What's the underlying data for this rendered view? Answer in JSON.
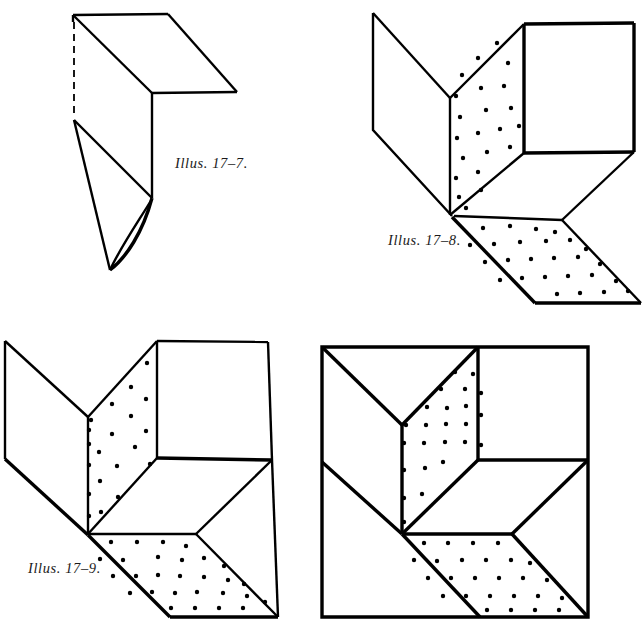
{
  "plate": {
    "title": "Illus. 17-7, 17-8, 17-9 — paper folding / dissection figures",
    "background_color": "#ffffff",
    "ink_color": "#000000",
    "width": 643,
    "height": 631
  },
  "captions": {
    "fig_a": "Illus. 17–7.",
    "fig_b": "Illus. 17–8.",
    "fig_c": "Illus. 17–9."
  },
  "figures": [
    {
      "id": "fig-17-7",
      "caption": "Illus. 17–7.",
      "position": "top-left",
      "description": "Folded sheet: a flat horizontal flap at top joined to a vertical panel that tapers to a curved point at the bottom; a dashed fold line runs down the left edge.",
      "has_stipple": false,
      "has_dashed_fold": true
    },
    {
      "id": "fig-17-8",
      "caption": "Illus. 17–8.",
      "position": "top-right",
      "description": "Open isometric box corner: blank left wing, stippled vertical center panel, blank right square face, and a stippled parallelogram floor below.",
      "has_stipple": true,
      "has_dashed_fold": false
    },
    {
      "id": "fig-17-9",
      "caption": "Illus. 17–9.",
      "position": "bottom-left",
      "description": "Same corner assembly as 17-8 but closed further: left wing folded flat, stippled center panel, blank right face, stippled floor parallelogram.",
      "has_stipple": true,
      "has_dashed_fold": false
    },
    {
      "id": "fig-17-10",
      "caption": "",
      "position": "bottom-right",
      "description": "The finished assembly fitted inside a heavy square border; stippled center panel and stippled floor parallelogram fill the square.",
      "has_stipple": true,
      "has_dashed_fold": false
    }
  ],
  "stipple": {
    "dot_color": "#000000",
    "dot_radius": 2.2,
    "note": "Stippled faces indicate the shaded/printed side of the paper."
  }
}
